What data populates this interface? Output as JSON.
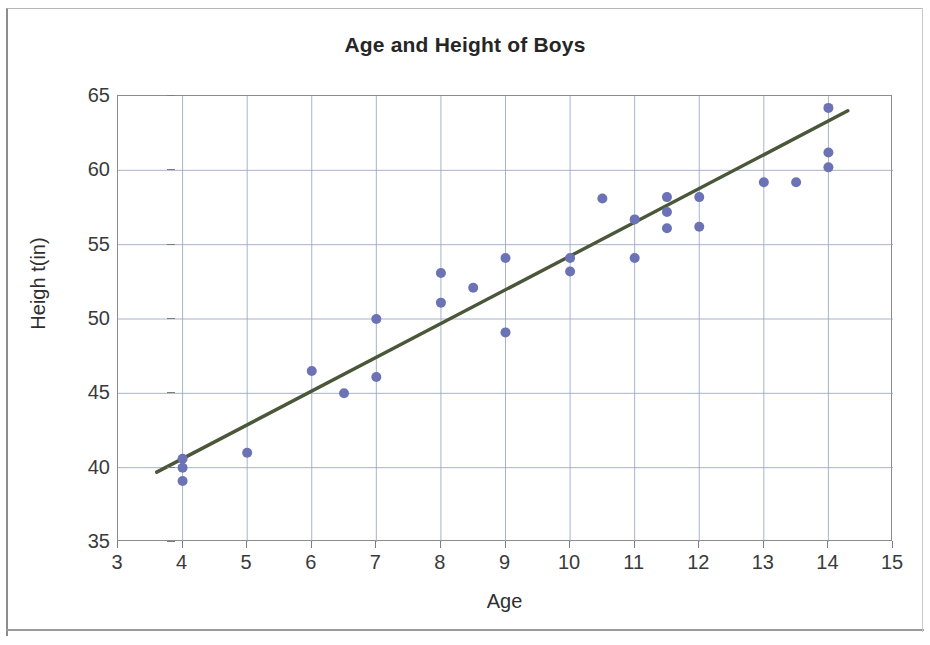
{
  "chart_data": {
    "type": "scatter",
    "title": "Age and Height of Boys",
    "xlabel": "Age",
    "ylabel": "Heigh t(in)",
    "xlim": [
      3,
      15
    ],
    "ylim": [
      35,
      65
    ],
    "xticks": [
      3,
      4,
      5,
      6,
      7,
      8,
      9,
      10,
      11,
      12,
      13,
      14,
      15
    ],
    "yticks": [
      35,
      40,
      45,
      50,
      55,
      60,
      65
    ],
    "grid": true,
    "legend": null,
    "marker_color": "#6b73b5",
    "trendline_color": "#4a5738",
    "points": [
      {
        "x": 4,
        "y": 40.6
      },
      {
        "x": 4,
        "y": 40.0
      },
      {
        "x": 4,
        "y": 39.1
      },
      {
        "x": 5,
        "y": 41.0
      },
      {
        "x": 6,
        "y": 46.5
      },
      {
        "x": 6.5,
        "y": 45.0
      },
      {
        "x": 7,
        "y": 50.0
      },
      {
        "x": 7,
        "y": 46.1
      },
      {
        "x": 8,
        "y": 53.1
      },
      {
        "x": 8,
        "y": 51.1
      },
      {
        "x": 8.5,
        "y": 52.1
      },
      {
        "x": 9,
        "y": 54.1
      },
      {
        "x": 9,
        "y": 49.1
      },
      {
        "x": 10,
        "y": 54.1
      },
      {
        "x": 10,
        "y": 53.2
      },
      {
        "x": 10.5,
        "y": 58.1
      },
      {
        "x": 11,
        "y": 56.7
      },
      {
        "x": 11,
        "y": 54.1
      },
      {
        "x": 11.5,
        "y": 58.2
      },
      {
        "x": 11.5,
        "y": 57.2
      },
      {
        "x": 11.5,
        "y": 56.1
      },
      {
        "x": 12,
        "y": 58.2
      },
      {
        "x": 12,
        "y": 56.2
      },
      {
        "x": 13,
        "y": 59.2
      },
      {
        "x": 13.5,
        "y": 59.2
      },
      {
        "x": 14,
        "y": 64.2
      },
      {
        "x": 14,
        "y": 61.2
      },
      {
        "x": 14,
        "y": 60.2
      }
    ],
    "trendline": {
      "x0": 3.6,
      "y0": 39.7,
      "x1": 14.3,
      "y1": 64.0
    }
  }
}
